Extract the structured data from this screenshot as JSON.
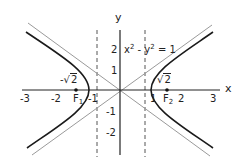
{
  "diagram": {
    "equation": {
      "x_term": "x",
      "x_exp": "2",
      "minus": " - ",
      "y_term": "y",
      "y_exp": "2",
      "rhs": " = 1"
    },
    "axes": {
      "x_label": "x",
      "y_label": "y"
    },
    "x_ticks": [
      "-3",
      "-2",
      "-1",
      "1",
      "2",
      "3"
    ],
    "y_ticks": [
      "2",
      "1",
      "-1",
      "-2"
    ],
    "foci": [
      {
        "name": "F",
        "sub": "1",
        "value_prefix": "-",
        "value_sqrt": "2"
      },
      {
        "name": "F",
        "sub": "2",
        "value_prefix": "",
        "value_sqrt": "2"
      }
    ],
    "sqrt_symbol": "√",
    "colors": {
      "curve": "#1a1a1a",
      "asymptote": "#9a9a9a",
      "axis": "#222222",
      "directrix": "#555555"
    }
  }
}
